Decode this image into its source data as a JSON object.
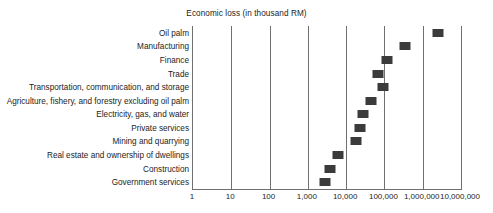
{
  "chart_data": {
    "type": "scatter",
    "title": "Economic loss (in thousand RM)",
    "xlabel": "",
    "ylabel": "",
    "xscale": "log",
    "xlim": [
      1,
      10000000
    ],
    "grid": true,
    "legend": false,
    "marker_color": "#3b3b3b",
    "axis_color": "#6f6f6f",
    "xticks": [
      {
        "value": 1,
        "label": "1"
      },
      {
        "value": 10,
        "label": "10"
      },
      {
        "value": 100,
        "label": "100"
      },
      {
        "value": 1000,
        "label": "1,000"
      },
      {
        "value": 10000,
        "label": "10,000"
      },
      {
        "value": 100000,
        "label": "100,000"
      },
      {
        "value": 1000000,
        "label": "1,000,000"
      },
      {
        "value": 10000000,
        "label": "10,000,000"
      }
    ],
    "categories": [
      "Oil palm",
      "Manufacturing",
      "Finance",
      "Trade",
      "Transportation, communication, and storage",
      "Agriculture, fishery, and forestry excluding oil palm",
      "Electricity, gas, and water",
      "Private services",
      "Mining and quarrying",
      "Real estate and ownership of dwellings",
      "Construction",
      "Government services"
    ],
    "values": [
      2500000,
      350000,
      120000,
      70000,
      90000,
      45000,
      28000,
      23000,
      18000,
      6000,
      3800,
      2800
    ],
    "points": [
      {
        "category": "Oil palm",
        "value": 2500000
      },
      {
        "category": "Manufacturing",
        "value": 350000
      },
      {
        "category": "Finance",
        "value": 120000
      },
      {
        "category": "Trade",
        "value": 70000
      },
      {
        "category": "Transportation, communication, and storage",
        "value": 90000
      },
      {
        "category": "Agriculture, fishery, and forestry excluding oil palm",
        "value": 45000
      },
      {
        "category": "Electricity, gas, and water",
        "value": 28000
      },
      {
        "category": "Private services",
        "value": 23000
      },
      {
        "category": "Mining and quarrying",
        "value": 18000
      },
      {
        "category": "Real estate and ownership of dwellings",
        "value": 6000
      },
      {
        "category": "Construction",
        "value": 3800
      },
      {
        "category": "Government services",
        "value": 2800
      }
    ]
  }
}
